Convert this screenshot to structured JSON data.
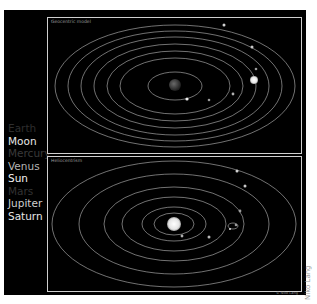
{
  "legend": {
    "items": [
      {
        "label": "Earth",
        "color": "#2e2e2e"
      },
      {
        "label": "Moon",
        "color": "#e8e8e8"
      },
      {
        "label": "Mercury",
        "color": "#3a3a3a"
      },
      {
        "label": "Venus",
        "color": "#b5b5b5"
      },
      {
        "label": "Sun",
        "color": "#f2f2f2"
      },
      {
        "label": "Mars",
        "color": "#333333"
      },
      {
        "label": "Jupiter",
        "color": "#cfcfcf"
      },
      {
        "label": "Saturn",
        "color": "#e6e6e6"
      }
    ]
  },
  "panels": {
    "top": {
      "title": "Geocentric model",
      "center_body": "Earth"
    },
    "bottom": {
      "title": "Heliocentrism",
      "center_body": "Sun"
    }
  },
  "credits": {
    "small": "© Niko Lang",
    "vertical": "Niko Lang"
  },
  "colors": {
    "background": "#000000",
    "frame": "#cfcfcf",
    "orbit": "#bdbdbd",
    "page": "#ffffff"
  }
}
